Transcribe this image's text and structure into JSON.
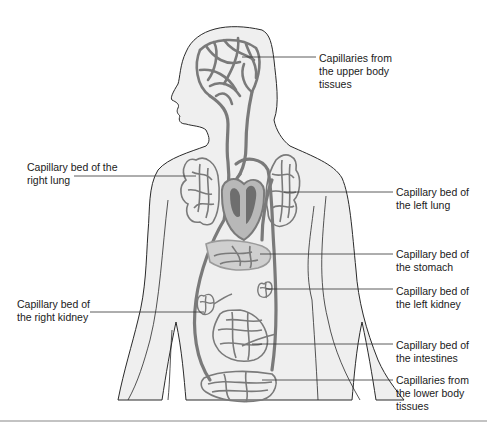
{
  "figure": {
    "labels": [
      {
        "id": "upper-body",
        "text": "Capillaries from\nthe upper body\ntissues",
        "x": 319,
        "y": 52
      },
      {
        "id": "right-lung",
        "text": "Capillary bed of the\nright lung",
        "x": 27,
        "y": 161
      },
      {
        "id": "left-lung",
        "text": "Capillary bed of\nthe left lung",
        "x": 396,
        "y": 186
      },
      {
        "id": "stomach",
        "text": "Capillary bed of\nthe stomach",
        "x": 396,
        "y": 248
      },
      {
        "id": "left-kidney",
        "text": "Capillary bed of\nthe left kidney",
        "x": 396,
        "y": 285
      },
      {
        "id": "right-kidney",
        "text": "Capillary bed of\nthe right kidney",
        "x": 17,
        "y": 298
      },
      {
        "id": "intestines",
        "text": "Capillary bed of\nthe intestines",
        "x": 396,
        "y": 339
      },
      {
        "id": "lower-body",
        "text": "Capillaries from\nthe lower body\ntissues",
        "x": 396,
        "y": 374
      }
    ],
    "colors": {
      "body_fill": "#efefef",
      "outline": "#2a2a2a",
      "vessel": "#7a7a7a",
      "vessel_light": "#9a9a9a",
      "heart_light": "#b8b8b8",
      "leader_line": "#333333",
      "rule": "#888888"
    }
  }
}
